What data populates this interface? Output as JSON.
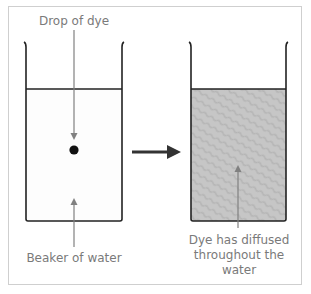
{
  "diagram": {
    "labels": {
      "drop_of_dye": "Drop of dye",
      "beaker_of_water": "Beaker of water",
      "dye_diffused": "Dye has diffused throughout the water"
    },
    "left_beaker": {
      "state": "before",
      "contents": "clear water with a single drop of dye"
    },
    "right_beaker": {
      "state": "after",
      "contents": "water uniformly tinted gray by diffused dye"
    },
    "transition_arrow": "right-arrow",
    "colors": {
      "outline": "#222222",
      "label_text": "#7a7a7a",
      "label_arrow": "#808080",
      "dyed_water": "#c4c4c4",
      "dye_drop": "#111111",
      "frame_border": "#cfcfcf"
    }
  }
}
